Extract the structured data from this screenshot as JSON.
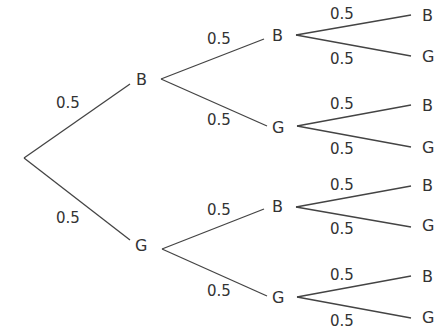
{
  "diagram": {
    "type": "probability-tree",
    "root": "start",
    "level1": [
      {
        "label": "B",
        "prob": "0.5"
      },
      {
        "label": "G",
        "prob": "0.5"
      }
    ],
    "level2": [
      {
        "label": "B",
        "prob": "0.5"
      },
      {
        "label": "G",
        "prob": "0.5"
      },
      {
        "label": "B",
        "prob": "0.5"
      },
      {
        "label": "G",
        "prob": "0.5"
      }
    ],
    "level3": [
      {
        "label": "B",
        "prob": "0.5"
      },
      {
        "label": "G",
        "prob": "0.5"
      },
      {
        "label": "B",
        "prob": "0.5"
      },
      {
        "label": "G",
        "prob": "0.5"
      },
      {
        "label": "B",
        "prob": "0.5"
      },
      {
        "label": "G",
        "prob": "0.5"
      },
      {
        "label": "B",
        "prob": "0.5"
      },
      {
        "label": "G",
        "prob": "0.5"
      }
    ]
  }
}
